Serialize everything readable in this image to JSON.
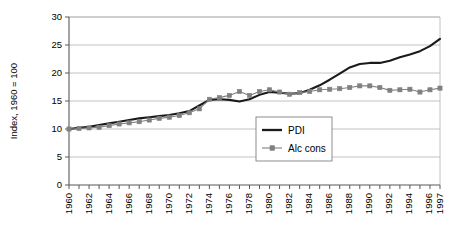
{
  "chart_data": {
    "type": "line",
    "title": "",
    "xlabel": "",
    "ylabel": "Index, 1960 = 100",
    "ylim": [
      0,
      30
    ],
    "yticks": [
      0,
      5,
      10,
      15,
      20,
      25,
      30
    ],
    "xlim": [
      1960,
      1997
    ],
    "grid": true,
    "legend_position": "center-right-inside",
    "x": [
      1960,
      1961,
      1962,
      1963,
      1964,
      1965,
      1966,
      1967,
      1968,
      1969,
      1970,
      1971,
      1972,
      1973,
      1974,
      1975,
      1976,
      1977,
      1978,
      1979,
      1980,
      1981,
      1982,
      1983,
      1984,
      1985,
      1986,
      1987,
      1988,
      1989,
      1990,
      1991,
      1992,
      1993,
      1994,
      1995,
      1996,
      1997
    ],
    "xtick_labels": [
      "1960",
      "1962",
      "1964",
      "1966",
      "1968",
      "1970",
      "1972",
      "1974",
      "1976",
      "1978",
      "1980",
      "1982",
      "1984",
      "1986",
      "1988",
      "1990",
      "1992",
      "1994",
      "1996",
      "1997"
    ],
    "xtick_values": [
      1960,
      1962,
      1964,
      1966,
      1968,
      1970,
      1972,
      1974,
      1976,
      1978,
      1980,
      1982,
      1984,
      1986,
      1988,
      1990,
      1992,
      1994,
      1996,
      1997
    ],
    "series": [
      {
        "name": "PDI",
        "style": "thick-solid-line",
        "color": "#1a1a1a",
        "markers": false,
        "values": [
          10.0,
          10.2,
          10.4,
          10.7,
          11.0,
          11.3,
          11.6,
          11.9,
          12.1,
          12.3,
          12.5,
          12.8,
          13.2,
          14.2,
          15.2,
          15.3,
          15.2,
          14.9,
          15.3,
          16.1,
          16.6,
          16.5,
          16.3,
          16.4,
          17.0,
          17.8,
          18.8,
          19.9,
          21.0,
          21.6,
          21.8,
          21.8,
          22.2,
          22.8,
          23.3,
          23.9,
          24.8,
          26.1
        ]
      },
      {
        "name": "Alc cons",
        "style": "thin-line-square-markers",
        "color": "#808080",
        "markers": true,
        "values": [
          10.0,
          10.1,
          10.2,
          10.3,
          10.6,
          10.9,
          11.1,
          11.3,
          11.6,
          11.9,
          12.1,
          12.4,
          12.9,
          13.6,
          15.3,
          15.6,
          16.0,
          16.7,
          16.0,
          16.7,
          17.0,
          16.6,
          16.2,
          16.5,
          16.7,
          17.0,
          17.1,
          17.2,
          17.4,
          17.7,
          17.7,
          17.4,
          16.9,
          17.0,
          17.1,
          16.6,
          17.0,
          17.3
        ]
      }
    ]
  },
  "legend": {
    "entries": [
      {
        "label": "PDI"
      },
      {
        "label": "Alc cons"
      }
    ]
  },
  "axis": {
    "y_title": "Index, 1960 = 100"
  }
}
